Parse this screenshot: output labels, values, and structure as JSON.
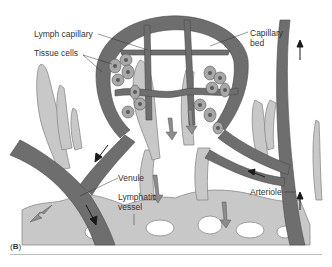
{
  "figure": {
    "panel_label": "B",
    "labels": {
      "lymph_capillary": "Lymph capillary",
      "tissue_cells": "Tissue cells",
      "capillary_bed": "Capillary",
      "capillary_bed_2": "bed",
      "venule": "Venule",
      "lymphatic_vessel": "Lymphatic",
      "lymphatic_vessel_2": "vessel",
      "arteriole": "Arteriole"
    },
    "colors": {
      "blood_vessel": "#6e6e6e",
      "lymph_vessel": "#c8c8c8",
      "cells": "#a8a8a8",
      "nucleus": "#5a5a5a",
      "arrow": "#1a1a1a",
      "background": "#ffffff"
    }
  }
}
